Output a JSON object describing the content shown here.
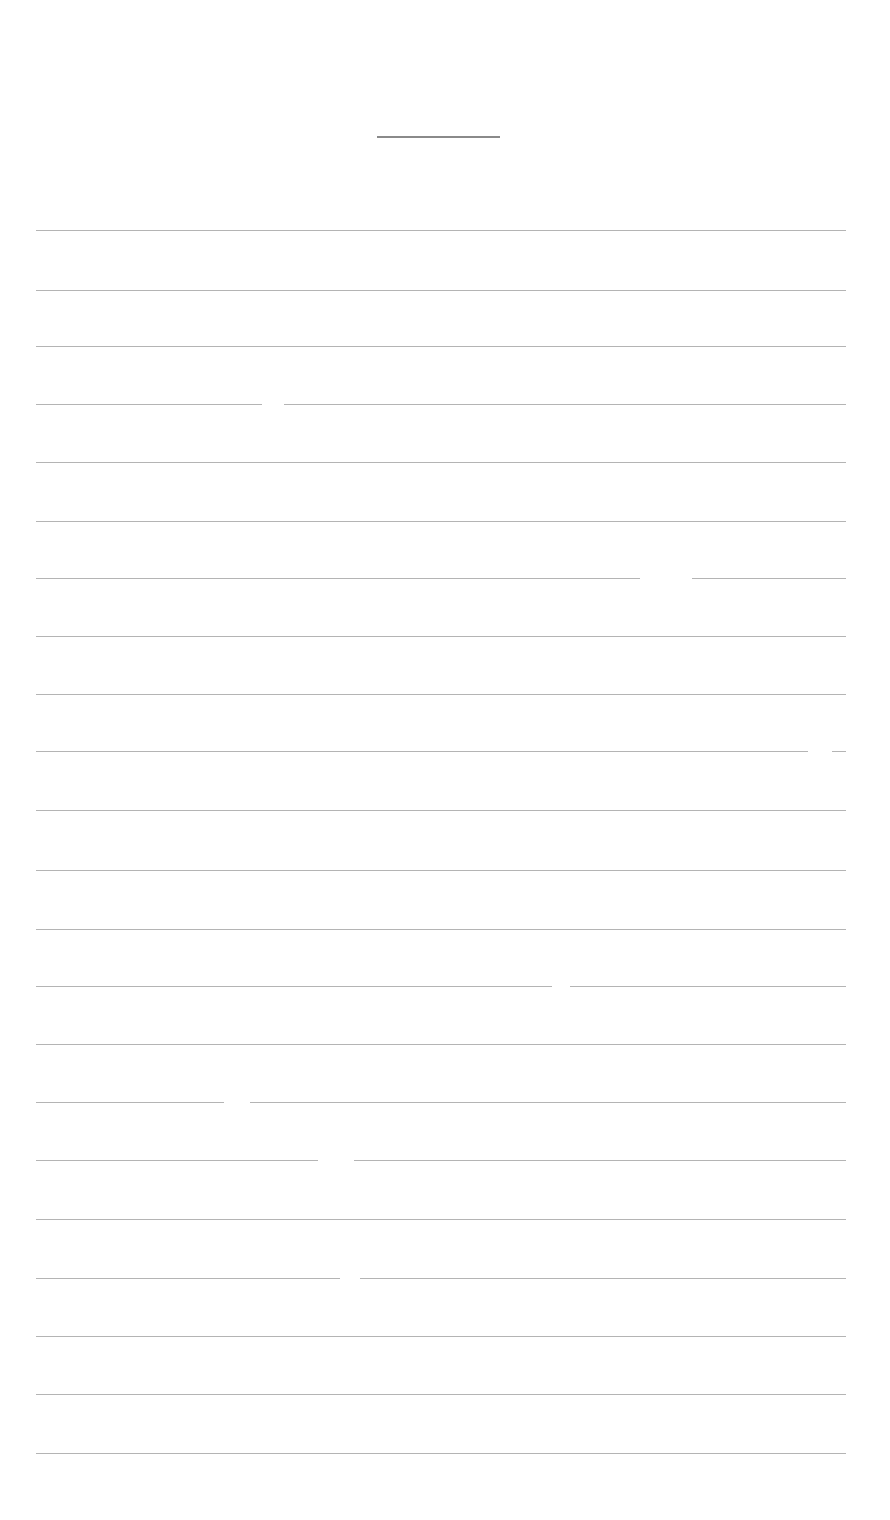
{
  "document": {
    "type": "lined-paper",
    "title": "",
    "title_line": {
      "x": 377,
      "y": 136,
      "width": 123
    },
    "rule_color": "#b4b4b4",
    "rules_y": [
      230,
      290,
      346,
      404,
      462,
      521,
      578,
      636,
      694,
      751,
      810,
      870,
      929,
      986,
      1044,
      1102,
      1160,
      1219,
      1278,
      1336,
      1394,
      1453
    ],
    "gaps": [
      {
        "y": 404,
        "x": 262,
        "width": 22
      },
      {
        "y": 578,
        "x": 640,
        "width": 52
      },
      {
        "y": 751,
        "x": 808,
        "width": 24
      },
      {
        "y": 986,
        "x": 552,
        "width": 18
      },
      {
        "y": 1102,
        "x": 224,
        "width": 26
      },
      {
        "y": 1160,
        "x": 318,
        "width": 36
      },
      {
        "y": 1278,
        "x": 340,
        "width": 20
      }
    ],
    "lines": []
  }
}
